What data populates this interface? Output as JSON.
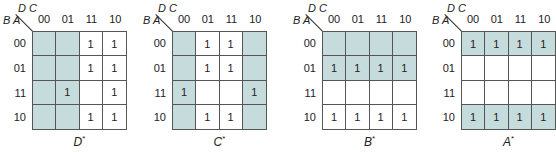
{
  "diagram": {
    "type": "karnaugh-maps",
    "column_variables": "D C",
    "row_variables": "B A",
    "column_labels": [
      "00",
      "01",
      "11",
      "10"
    ],
    "row_labels": [
      "00",
      "01",
      "11",
      "10"
    ],
    "shade_color": "#c6dcdc",
    "maps": [
      {
        "name": "D",
        "suffix": "*",
        "left": 0,
        "grid_left": 32,
        "cells": [
          [
            "",
            "",
            "1",
            "1"
          ],
          [
            "",
            "",
            "1",
            "1"
          ],
          [
            "",
            "1",
            "",
            "1"
          ],
          [
            "",
            "",
            "1",
            "1"
          ]
        ],
        "shaded": [
          [
            1,
            1,
            0,
            0
          ],
          [
            1,
            1,
            0,
            0
          ],
          [
            1,
            1,
            0,
            0
          ],
          [
            1,
            1,
            0,
            0
          ]
        ]
      },
      {
        "name": "C",
        "suffix": "*",
        "left": 140,
        "grid_left": 172,
        "cells": [
          [
            "",
            "1",
            "1",
            ""
          ],
          [
            "",
            "1",
            "1",
            ""
          ],
          [
            "1",
            "",
            "",
            "1"
          ],
          [
            "",
            "1",
            "1",
            ""
          ]
        ],
        "shaded": [
          [
            1,
            0,
            0,
            1
          ],
          [
            1,
            0,
            0,
            1
          ],
          [
            1,
            0,
            0,
            1
          ],
          [
            1,
            0,
            0,
            1
          ]
        ]
      },
      {
        "name": "B",
        "suffix": "*",
        "left": 290,
        "grid_left": 322,
        "cells": [
          [
            "",
            "",
            "",
            ""
          ],
          [
            "1",
            "1",
            "1",
            "1"
          ],
          [
            "",
            "",
            "",
            ""
          ],
          [
            "1",
            "1",
            "1",
            "1"
          ]
        ],
        "shaded": [
          [
            1,
            1,
            1,
            1
          ],
          [
            1,
            1,
            1,
            1
          ],
          [
            0,
            0,
            0,
            0
          ],
          [
            0,
            0,
            0,
            0
          ]
        ]
      },
      {
        "name": "A",
        "suffix": "*",
        "left": 429,
        "grid_left": 461,
        "cells": [
          [
            "1",
            "1",
            "1",
            "1"
          ],
          [
            "",
            "",
            "",
            ""
          ],
          [
            "",
            "",
            "",
            ""
          ],
          [
            "1",
            "1",
            "1",
            "1"
          ]
        ],
        "shaded": [
          [
            1,
            1,
            1,
            1
          ],
          [
            0,
            0,
            0,
            0
          ],
          [
            0,
            0,
            0,
            0
          ],
          [
            1,
            1,
            1,
            1
          ]
        ]
      }
    ]
  }
}
